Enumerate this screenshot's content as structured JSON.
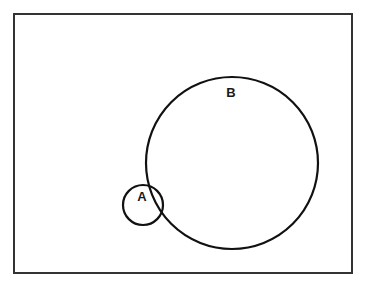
{
  "diagram": {
    "type": "venn",
    "universe": {
      "x": 14,
      "y": 14,
      "width": 338,
      "height": 259,
      "stroke": "#333333"
    },
    "sets": [
      {
        "label": "A",
        "cx": 143,
        "cy": 205,
        "r": 20,
        "label_x": 142,
        "label_y": 201
      },
      {
        "label": "B",
        "cx": 232,
        "cy": 163,
        "r": 86,
        "label_x": 231,
        "label_y": 97
      }
    ],
    "stroke_color": "#111111"
  }
}
